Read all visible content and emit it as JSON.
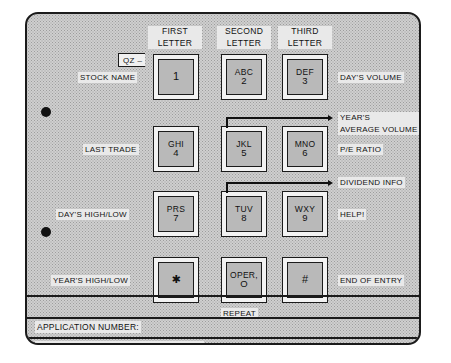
{
  "panel": {
    "title": "Stock quote telephone keypad overlay"
  },
  "column_headers": [
    {
      "line1": "FIRST",
      "line2": "LETTER"
    },
    {
      "line1": "SECOND",
      "line2": "LETTER"
    },
    {
      "line1": "THIRD",
      "line2": "LETTER"
    }
  ],
  "qz_box": {
    "text": "QZ –"
  },
  "keys": [
    {
      "letters": "",
      "digit": "1",
      "name": "key-1"
    },
    {
      "letters": "ABC",
      "digit": "2",
      "name": "key-2"
    },
    {
      "letters": "DEF",
      "digit": "3",
      "name": "key-3"
    },
    {
      "letters": "GHI",
      "digit": "4",
      "name": "key-4"
    },
    {
      "letters": "JKL",
      "digit": "5",
      "name": "key-5"
    },
    {
      "letters": "MNO",
      "digit": "6",
      "name": "key-6"
    },
    {
      "letters": "PRS",
      "digit": "7",
      "name": "key-7"
    },
    {
      "letters": "TUV",
      "digit": "8",
      "name": "key-8"
    },
    {
      "letters": "WXY",
      "digit": "9",
      "name": "key-9"
    },
    {
      "letters": "",
      "digit": "✱",
      "name": "key-star"
    },
    {
      "letters": "OPER,",
      "digit": "O",
      "name": "key-oper-zero"
    },
    {
      "letters": "",
      "digit": "#",
      "name": "key-pound"
    }
  ],
  "left_labels": [
    {
      "text": "STOCK NAME",
      "name": "label-stock-name"
    },
    {
      "text": "LAST TRADE",
      "name": "label-last-trade"
    },
    {
      "text": "DAY'S HIGH/LOW",
      "name": "label-days-high-low"
    },
    {
      "text": "YEAR'S HIGH/LOW",
      "name": "label-years-high-low"
    }
  ],
  "right_labels": {
    "days_volume": "DAY'S VOLUME",
    "years_average_volume_line1": "YEAR'S",
    "years_average_volume_line2": "AVERAGE VOLUME",
    "pe_ratio": "P/E RATIO",
    "dividend_info": "DIVIDEND INFO",
    "help": "HELP!",
    "end_of_entry": "END OF ENTRY"
  },
  "repeat_label": "REPEAT",
  "footer_fields": [
    {
      "text": "APPLICATION NUMBER:",
      "name": "field-application-number"
    },
    {
      "text": "TELEPHONE NUMBER OF COMPUTER:",
      "name": "field-telephone-number-of-computer"
    }
  ],
  "colors": {
    "panel_bg": "#cfcfcf",
    "ink": "#1b1b1b",
    "keycap": "#b9b9b9",
    "bezel": "#f2f2f2"
  }
}
